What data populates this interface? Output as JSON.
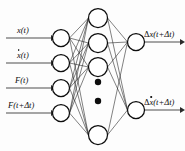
{
  "figure": {
    "background_color": "#fdfdfd",
    "line_color": "#1a1a1a",
    "node_fill": "#ffffff",
    "node_stroke": "#0d0d0d",
    "arrow_color": "#4f4f4f"
  },
  "layers": {
    "input": {
      "name": "input-layer",
      "node_count": 4,
      "cx": 61,
      "radius": 8.5,
      "cy": [
        38,
        63,
        88,
        113
      ]
    },
    "hidden": {
      "name": "hidden-layer",
      "visible_node_count": 4,
      "cx": 98,
      "radius": 9.5,
      "cy": [
        18,
        43,
        67,
        135
      ],
      "ellipsis_dots": [
        {
          "cx": 98,
          "cy": 82,
          "r": 3.2
        },
        {
          "cx": 98,
          "cy": 101,
          "r": 3.2
        }
      ]
    },
    "output": {
      "name": "output-layer",
      "node_count": 2,
      "cx": 136,
      "radius": 8.5,
      "cy": [
        42,
        110
      ]
    }
  },
  "inputs": [
    {
      "id": "input-1",
      "label_main": "x",
      "label_rest": "(t)",
      "dotted": false,
      "label_x": 17,
      "label_y": 26,
      "arrow_y": 38,
      "arrow_x1": 6,
      "arrow_x2": 52
    },
    {
      "id": "input-2",
      "label_main": "x",
      "label_rest": "(t)",
      "dotted": true,
      "label_x": 17,
      "label_y": 51,
      "arrow_y": 63,
      "arrow_x1": 6,
      "arrow_x2": 52
    },
    {
      "id": "input-3",
      "label_main": "F",
      "label_rest": "(t)",
      "dotted": false,
      "label_x": 15,
      "label_y": 76,
      "arrow_y": 88,
      "arrow_x1": 6,
      "arrow_x2": 52
    },
    {
      "id": "input-4",
      "label_main": "F",
      "label_rest": "(t+Δt)",
      "dotted": false,
      "label_x": 8,
      "label_y": 101,
      "arrow_y": 113,
      "arrow_x1": 6,
      "arrow_x2": 52
    }
  ],
  "outputs": [
    {
      "id": "output-1",
      "label_prefix": "Δ",
      "label_main": "x",
      "label_rest": "(t+Δt)",
      "dotted": false,
      "label_x": 144,
      "label_y": 30,
      "arrow_y": 42,
      "arrow_x1": 145,
      "arrow_x2": 181
    },
    {
      "id": "output-2",
      "label_prefix": "Δ",
      "label_main": "x",
      "label_rest": "(t+Δt)",
      "dotted": true,
      "label_x": 144,
      "label_y": 98,
      "arrow_y": 110,
      "arrow_x1": 145,
      "arrow_x2": 181
    }
  ],
  "labels_text": {
    "input_1": "x (t)",
    "input_2": "ẋ (t)",
    "input_3": "F(t)",
    "input_4": "F(t+Δt)",
    "output_1": "Δx (t+Δt)",
    "output_2": "Δẋ (t+Δt)"
  }
}
